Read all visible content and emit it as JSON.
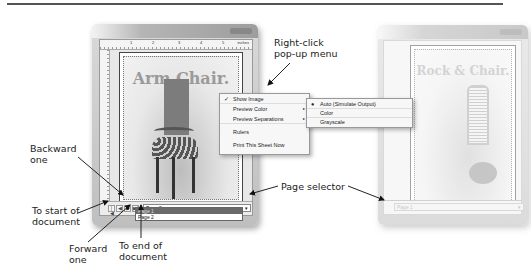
{
  "annotations": {
    "right_click_menu": "Right-click pop-up menu",
    "right_click_menu_line1": "Right-click",
    "right_click_menu_line2": "pop-up menu",
    "backward_one_line1": "Backward",
    "backward_one_line2": "one",
    "to_start_line1": "To start of",
    "to_start_line2": "document",
    "forward_one_line1": "Forward",
    "forward_one_line2": "one",
    "to_end_line1": "To end of",
    "to_end_line2": "document",
    "page_selector": "Page selector"
  },
  "left_window": {
    "ruler": {
      "numbers": [
        "1",
        "2",
        "3",
        "4",
        "5"
      ],
      "units": "inches"
    },
    "page_title": "Arm Chair.",
    "nav_buttons": {
      "first": "|◀",
      "prev": "◀",
      "next": "▶",
      "last": "▶|"
    },
    "page_selector": {
      "value": "Page 2",
      "arrow": "▾",
      "options": [
        "Page 1",
        "Page 2"
      ],
      "highlighted": "Page 1"
    }
  },
  "context_menu": {
    "items": [
      {
        "label": "Show Image",
        "checked": true,
        "mark": "✓"
      },
      {
        "label": "Preview Color",
        "submenu": true,
        "arrow": "▸"
      },
      {
        "label": "Preview Separations",
        "submenu": true,
        "arrow": "▸"
      },
      {
        "label": "Rulers"
      },
      {
        "label": "Print This Sheet Now"
      }
    ]
  },
  "submenu": {
    "items": [
      {
        "label": "Auto (Simulate Output)",
        "selected": true,
        "mark": "●"
      },
      {
        "label": "Color"
      },
      {
        "label": "Grayscale"
      }
    ]
  },
  "right_window": {
    "page_title": "Rock & Chair.",
    "page_selector": {
      "value": "Page 1",
      "arrow": "▾"
    }
  },
  "colors": {
    "annotation_text": "#222222",
    "menu_background": "#f7f7f7",
    "dropdown_highlight": "#6a6a6a"
  }
}
